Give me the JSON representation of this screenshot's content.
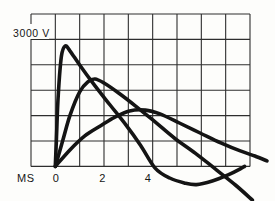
{
  "figure": {
    "y_axis_label": "3000 V",
    "x_axis_label": "MS",
    "x_tick_labels": [
      "0",
      "2",
      "4"
    ],
    "colors": {
      "ink": "#141414",
      "grid": "#2e2e2e",
      "paper": "#fdfdfb"
    }
  },
  "chart_data": {
    "type": "line",
    "title": "",
    "xlabel": "MS",
    "ylabel": "V",
    "y_reference_label": "3000 V",
    "y_reference_value": 3000,
    "x_ticks": [
      0,
      2,
      4
    ],
    "xlim": [
      -1,
      8
    ],
    "ylim": [
      -900,
      3600
    ],
    "grid": {
      "on": true,
      "columns": 9,
      "rows": 6,
      "ms_per_column": 1,
      "volts_per_row": 600
    },
    "legend_position": "none",
    "series": [
      {
        "name": "curve-1-fast-impulse",
        "peak_ms": 0.4,
        "peak_v": 2850,
        "points": [
          [
            0.0,
            0
          ],
          [
            0.05,
            700
          ],
          [
            0.12,
            1700
          ],
          [
            0.25,
            2600
          ],
          [
            0.4,
            2845
          ],
          [
            0.6,
            2730
          ],
          [
            1.0,
            2395
          ],
          [
            1.6,
            1925
          ],
          [
            2.25,
            1450
          ],
          [
            2.9,
            980
          ],
          [
            3.5,
            500
          ],
          [
            4.1,
            -40
          ],
          [
            4.7,
            -275
          ],
          [
            5.3,
            -390
          ],
          [
            5.8,
            -430
          ],
          [
            6.45,
            -345
          ],
          [
            7.1,
            -200
          ],
          [
            7.6,
            -60
          ],
          [
            7.78,
            0
          ]
        ]
      },
      {
        "name": "curve-2-medium-impulse",
        "peak_ms": 1.6,
        "peak_v": 2070,
        "points": [
          [
            0.0,
            0
          ],
          [
            0.3,
            600
          ],
          [
            0.6,
            1200
          ],
          [
            1.0,
            1760
          ],
          [
            1.35,
            2000
          ],
          [
            1.63,
            2065
          ],
          [
            2.0,
            1970
          ],
          [
            2.6,
            1735
          ],
          [
            3.3,
            1425
          ],
          [
            4.1,
            1050
          ],
          [
            4.9,
            665
          ],
          [
            5.75,
            315
          ],
          [
            6.57,
            -60
          ],
          [
            7.4,
            -440
          ],
          [
            8.1,
            -795
          ]
        ]
      },
      {
        "name": "curve-3-slow-impulse",
        "peak_ms": 3.7,
        "peak_v": 1330,
        "points": [
          [
            0.0,
            0
          ],
          [
            0.6,
            390
          ],
          [
            1.2,
            715
          ],
          [
            1.85,
            955
          ],
          [
            2.45,
            1165
          ],
          [
            3.05,
            1310
          ],
          [
            3.7,
            1330
          ],
          [
            4.3,
            1240
          ],
          [
            5.1,
            1025
          ],
          [
            5.95,
            790
          ],
          [
            6.8,
            555
          ],
          [
            7.6,
            365
          ],
          [
            8.2,
            245
          ],
          [
            8.7,
            130
          ]
        ]
      }
    ]
  }
}
